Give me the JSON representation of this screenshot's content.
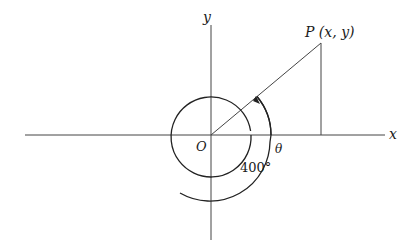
{
  "diagram": {
    "type": "angle-in-standard-position",
    "labels": {
      "x_axis": "x",
      "y_axis": "y",
      "origin": "O",
      "point": "P (x, y)",
      "reference_angle": "θ",
      "rotation_angle": "400°"
    },
    "angle_degrees": 400,
    "reference_angle_degrees": 40,
    "colors": {
      "stroke": "#333333",
      "background": "#ffffff"
    }
  }
}
